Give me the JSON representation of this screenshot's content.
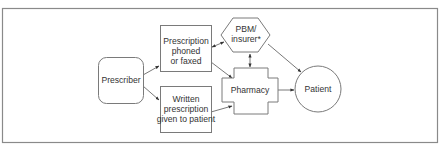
{
  "diagram": {
    "type": "flowchart",
    "frame_color": "#8a8a8a",
    "nodes": {
      "prescriber": {
        "label": "Prescriber",
        "shape": "rounded-rectangle"
      },
      "phoned": {
        "label_lines": [
          "Prescription",
          "phoned",
          "or faxed"
        ],
        "shape": "rectangle"
      },
      "written": {
        "label_lines": [
          "Written",
          "prescription",
          "given to patient"
        ],
        "shape": "rectangle"
      },
      "pbm": {
        "label_lines": [
          "PBM/",
          "insurer*"
        ],
        "shape": "hexagon"
      },
      "pharmacy": {
        "label": "Pharmacy",
        "shape": "cross"
      },
      "patient": {
        "label": "Patient",
        "shape": "circle"
      }
    },
    "edges": [
      {
        "from": "Prescriber",
        "to": "Prescription phoned or faxed",
        "direction": "forward"
      },
      {
        "from": "Prescriber",
        "to": "Written prescription given to patient",
        "direction": "forward"
      },
      {
        "from": "Prescription phoned or faxed",
        "to": "PBM/insurer*",
        "direction": "both"
      },
      {
        "from": "Prescription phoned or faxed",
        "to": "Pharmacy",
        "direction": "forward"
      },
      {
        "from": "Written prescription given to patient",
        "to": "Pharmacy",
        "direction": "forward"
      },
      {
        "from": "PBM/insurer*",
        "to": "Pharmacy",
        "direction": "both"
      },
      {
        "from": "PBM/insurer*",
        "to": "Patient",
        "direction": "forward"
      },
      {
        "from": "Pharmacy",
        "to": "Patient",
        "direction": "forward"
      }
    ]
  }
}
